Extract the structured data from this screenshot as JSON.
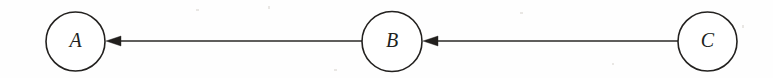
{
  "diagram": {
    "type": "directed-graph",
    "background_color": "#fefefe",
    "stroke_color": "#23211f",
    "label_color": "#211f1d",
    "canvas": {
      "width": 773,
      "height": 78
    },
    "nodes": [
      {
        "id": "A",
        "label": "A",
        "cx": 75.5,
        "cy": 41.5,
        "r": 29.5
      },
      {
        "id": "B",
        "label": "B",
        "cx": 392,
        "cy": 41.5,
        "r": 30
      },
      {
        "id": "C",
        "label": "C",
        "cx": 707.5,
        "cy": 41.5,
        "r": 29.5
      }
    ],
    "edges": [
      {
        "id": "edge-b-a",
        "from": "B",
        "to": "A",
        "direction": "left",
        "line_x1": 362,
        "line_x2": 121,
        "y": 41,
        "arrow_tip_x": 106,
        "arrow_back_x": 121,
        "arrow_half_height": 5.2
      },
      {
        "id": "edge-c-b",
        "from": "C",
        "to": "B",
        "direction": "left",
        "line_x1": 678,
        "line_x2": 438,
        "y": 41,
        "arrow_tip_x": 423,
        "arrow_back_x": 438,
        "arrow_half_height": 5.2
      }
    ],
    "specks": [
      {
        "x": 196,
        "y": 9,
        "w": 3,
        "h": 2
      },
      {
        "x": 268,
        "y": 6,
        "w": 2,
        "h": 3
      },
      {
        "x": 520,
        "y": 12,
        "w": 3,
        "h": 2
      },
      {
        "x": 612,
        "y": 63,
        "w": 2,
        "h": 2
      },
      {
        "x": 334,
        "y": 69,
        "w": 3,
        "h": 2
      },
      {
        "x": 742,
        "y": 25,
        "w": 2,
        "h": 3
      }
    ]
  }
}
